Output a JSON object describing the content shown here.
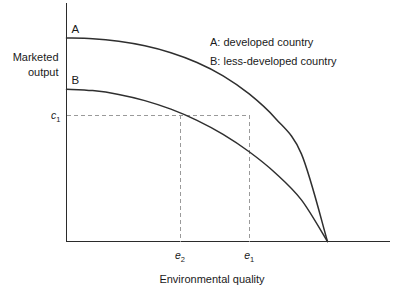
{
  "chart_data": {
    "type": "line",
    "title": "",
    "xlabel": "Environmental quality",
    "ylabel_line1": "Marketed",
    "ylabel_line2": "output",
    "grid": false,
    "axes_arrows": false,
    "xlim": [
      0,
      1.2
    ],
    "ylim": [
      0,
      1.05
    ],
    "axis_ticks_shown": false,
    "series": [
      {
        "name": "A",
        "label": "A",
        "legend": "A: developed country",
        "description": "developed country production possibility frontier, concave, starts high on vertical axis",
        "x": [
          0.0,
          0.1,
          0.2,
          0.3,
          0.4,
          0.5,
          0.6,
          0.7,
          0.8,
          0.9,
          1.0
        ],
        "y": [
          0.855,
          0.852,
          0.841,
          0.822,
          0.793,
          0.752,
          0.696,
          0.62,
          0.518,
          0.368,
          0.0
        ]
      },
      {
        "name": "B",
        "label": "B",
        "legend": "B: less-developed country",
        "description": "less-developed country production possibility frontier, concave, starts lower on vertical axis",
        "x": [
          0.0,
          0.1,
          0.2,
          0.3,
          0.4,
          0.5,
          0.6,
          0.7,
          0.8,
          0.9,
          1.0
        ],
        "y": [
          0.64,
          0.634,
          0.618,
          0.592,
          0.556,
          0.509,
          0.45,
          0.377,
          0.288,
          0.175,
          0.0
        ]
      }
    ],
    "annotations": [
      {
        "name": "c1-level",
        "text": "c",
        "subscript": "1",
        "kind": "y-value",
        "value": 0.53,
        "axis": "y"
      },
      {
        "name": "e2-point",
        "text": "e",
        "subscript": "2",
        "kind": "x-value",
        "value": 0.435,
        "axis": "x",
        "on_curve": "B"
      },
      {
        "name": "e1-point",
        "text": "e",
        "subscript": "1",
        "kind": "x-value",
        "value": 0.7,
        "axis": "x",
        "on_curve": "A"
      }
    ],
    "guides": [
      {
        "name": "horizontal-guide-c1",
        "orientation": "horizontal",
        "y": 0.53,
        "x_from": 0.0,
        "x_to": 0.7,
        "style": "dashed"
      },
      {
        "name": "vertical-guide-e2",
        "orientation": "vertical",
        "x": 0.435,
        "y_from": 0.0,
        "y_to": 0.53,
        "style": "dashed"
      },
      {
        "name": "vertical-guide-e1",
        "orientation": "vertical",
        "x": 0.7,
        "y_from": 0.0,
        "y_to": 0.53,
        "style": "dashed"
      }
    ],
    "legend": {
      "position": "upper-right-inside",
      "entries": [
        "A: developed country",
        "B: less-developed country"
      ]
    },
    "colors": {
      "curve": "#2f2f2f",
      "axis": "#2b2b2b",
      "guide": "#9a9a9a",
      "text": "#1a1a1a",
      "background": "#ffffff"
    }
  },
  "labels": {
    "ylabel_line1": "Marketed",
    "ylabel_line2": "output",
    "xlabel": "Environmental quality",
    "curve_a": "A",
    "curve_b": "B",
    "legend_a": "A: developed country",
    "legend_b": "B: less-developed country",
    "tick_c1_base": "c",
    "tick_c1_sub": "1",
    "tick_e2_base": "e",
    "tick_e2_sub": "2",
    "tick_e1_base": "e",
    "tick_e1_sub": "1"
  }
}
